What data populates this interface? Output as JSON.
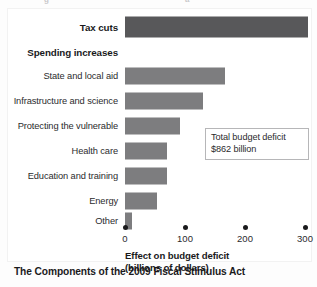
{
  "caption": "The Components of the 2009 Fiscal Stimulus Act",
  "callout": {
    "line1": "Total budget deficit",
    "line2": "$862 billion"
  },
  "top_bleed": {
    "left_glyph": "g",
    "right_glyph": "a"
  },
  "chart_data": {
    "type": "bar",
    "orientation": "horizontal",
    "title": "The Components of the 2009 Fiscal Stimulus Act",
    "xlabel_line1": "Effect on budget deficit",
    "xlabel_line2": "(billions of dollars)",
    "ylabel": "",
    "xlim": [
      0,
      310
    ],
    "xticks": [
      0,
      100,
      200,
      300
    ],
    "xticklabels": [
      "0",
      "100",
      "200",
      "300"
    ],
    "grid": false,
    "legend": false,
    "tick_marker": "dot",
    "bar_color": "#7d7d7f",
    "highlight_bar_color": "#58585a",
    "annotation": "Total budget deficit $862 billion",
    "categories": [
      "Tax cuts",
      "Spending increases",
      "State and local aid",
      "Infrastructure and science",
      "Protecting the vulnerable",
      "Health care",
      "Education and training",
      "Energy",
      "Other"
    ],
    "values": [
      305,
      null,
      167,
      130,
      91,
      70,
      70,
      54,
      11
    ],
    "rows": [
      {
        "label": "Tax cuts",
        "value": 305,
        "emphasis": true,
        "is_group_header": false,
        "dark": true
      },
      {
        "label": "Spending increases",
        "value": null,
        "emphasis": true,
        "is_group_header": true,
        "dark": false
      },
      {
        "label": "State and local aid",
        "value": 167,
        "emphasis": false,
        "is_group_header": false,
        "dark": false
      },
      {
        "label": "Infrastructure and science",
        "value": 130,
        "emphasis": false,
        "is_group_header": false,
        "dark": false
      },
      {
        "label": "Protecting the vulnerable",
        "value": 91,
        "emphasis": false,
        "is_group_header": false,
        "dark": false
      },
      {
        "label": "Health care",
        "value": 70,
        "emphasis": false,
        "is_group_header": false,
        "dark": false
      },
      {
        "label": "Education and training",
        "value": 70,
        "emphasis": false,
        "is_group_header": false,
        "dark": false
      },
      {
        "label": "Energy",
        "value": 54,
        "emphasis": false,
        "is_group_header": false,
        "dark": false
      },
      {
        "label": "Other",
        "value": 11,
        "emphasis": false,
        "is_group_header": false,
        "dark": false
      }
    ]
  }
}
